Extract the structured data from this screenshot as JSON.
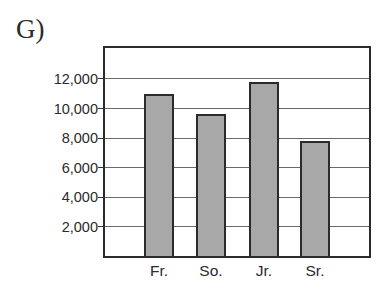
{
  "panel": {
    "label": "G)"
  },
  "chart_data": {
    "type": "bar",
    "title": "",
    "xlabel": "",
    "ylabel": "",
    "categories": [
      "Fr.",
      "So.",
      "Jr.",
      "Sr."
    ],
    "values": [
      11000,
      9600,
      11800,
      7800
    ],
    "yticks": [
      2000,
      4000,
      6000,
      8000,
      10000,
      12000
    ],
    "ytick_labels": [
      "2,000",
      "4,000",
      "6,000",
      "8,000",
      "10,000",
      "12,000"
    ],
    "ylim": [
      0,
      14000
    ],
    "grid": true,
    "legend": null,
    "bar_color": "#a8a8a8",
    "edge_color": "#2b2b2b"
  }
}
